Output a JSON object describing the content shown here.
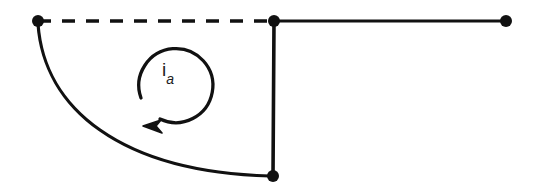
{
  "diagram": {
    "kind": "circuit-loop-fragment",
    "background_color": "#ffffff",
    "stroke_color": "#111111",
    "canvas": {
      "width": 533,
      "height": 188
    },
    "current_label": {
      "symbol": "i",
      "subscript": "a",
      "full_text": "ia",
      "x": 162,
      "y": 60
    },
    "nodes": [
      {
        "name": "top-left-node",
        "x": 38,
        "y": 21,
        "radius": 6
      },
      {
        "name": "top-junction-node",
        "x": 274,
        "y": 21,
        "radius": 6
      },
      {
        "name": "top-right-node",
        "x": 506,
        "y": 21,
        "radius": 6
      },
      {
        "name": "bottom-node",
        "x": 273,
        "y": 176,
        "radius": 6
      }
    ],
    "edges": [
      {
        "name": "dashed-top-left-wire",
        "style": "dashed",
        "from": "top-left-node",
        "to": "top-junction-node",
        "dash_pattern": "13 11",
        "width": 3.6
      },
      {
        "name": "solid-top-right-wire",
        "style": "solid",
        "from": "top-junction-node",
        "to": "top-right-node",
        "width": 3.2
      },
      {
        "name": "vertical-wire",
        "style": "solid",
        "from": "top-junction-node",
        "to": "bottom-node",
        "width": 3.6
      },
      {
        "name": "curved-branch-wire",
        "style": "solid-curved",
        "from": "top-left-node",
        "to": "bottom-node",
        "width": 3.2,
        "control_points": [
          [
            44,
            108
          ],
          [
            120,
            172
          ]
        ]
      }
    ],
    "current_arrow": {
      "name": "counterclockwise-current-arrow",
      "direction": "counterclockwise",
      "center_x": 178,
      "center_y": 87,
      "radius": 37,
      "stroke_width": 3.2,
      "arrowhead_tip_x": 144,
      "arrowhead_tip_y": 126
    }
  }
}
